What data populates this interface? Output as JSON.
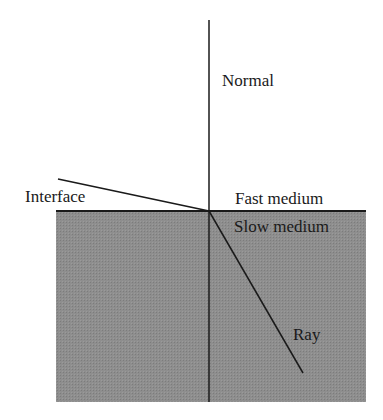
{
  "diagram": {
    "labels": {
      "normal": "Normal",
      "interface": "Interface",
      "fast_medium": "Fast medium",
      "slow_medium": "Slow medium",
      "ray": "Ray"
    },
    "colors": {
      "background": "#ffffff",
      "slow_medium_fill": "#8c8c8c",
      "line": "#1a1a1a"
    },
    "geometry": {
      "slow_medium_rect": {
        "x": 56,
        "y": 210,
        "width": 310,
        "height": 192
      },
      "normal_line": {
        "x1": 209,
        "y1": 20,
        "x2": 209,
        "y2": 402
      },
      "interface_incident_line": {
        "x1": 58,
        "y1": 179,
        "x2": 209,
        "y2": 211
      },
      "refracted_ray": {
        "x1": 209,
        "y1": 211,
        "x2": 303,
        "y2": 373
      }
    }
  }
}
